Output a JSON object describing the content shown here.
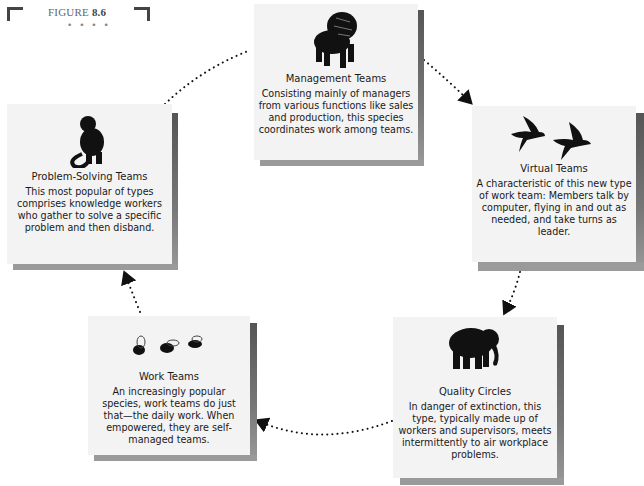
{
  "figure": {
    "label": "FIGURE",
    "number": "8.6",
    "ornament": "• • • •"
  },
  "teams": {
    "management": {
      "icon": "lion-icon",
      "title": "Management Teams",
      "description": "Consisting mainly of managers from various functions like sales and production, this species coordinates work among teams."
    },
    "virtual": {
      "icon": "birds-icon",
      "title": "Virtual Teams",
      "description": "A characteristic of this new type of work team: Members talk by computer, flying in and out as needed, and take turns as leader."
    },
    "quality": {
      "icon": "elephant-icon",
      "title": "Quality Circles",
      "description": "In danger of extinction, this type, typically made up of workers and supervisors, meets intermittently to air workplace problems."
    },
    "work": {
      "icon": "bees-icon",
      "title": "Work Teams",
      "description": "An increasingly popular species, work teams do just that—the daily work. When empowered, they are self-managed teams."
    },
    "problem": {
      "icon": "monkey-icon",
      "title": "Problem-Solving Teams",
      "description": "This most popular of types comprises knowledge workers who gather to solve a specific problem and then disband."
    }
  },
  "cycle_order": [
    "Management Teams",
    "Virtual Teams",
    "Quality Circles",
    "Work Teams",
    "Problem-Solving Teams"
  ]
}
